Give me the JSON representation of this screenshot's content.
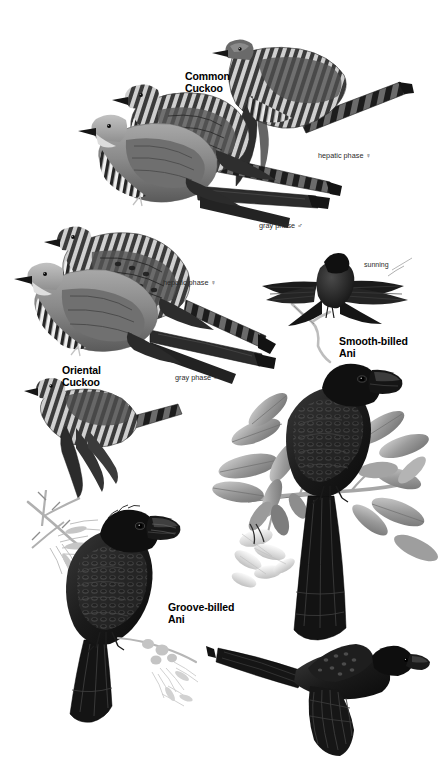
{
  "plate": {
    "background_color": "#ffffff",
    "width": 443,
    "height": 765,
    "medium": "grayscale field-guide illustration plate"
  },
  "species_labels": [
    {
      "id": "common-cuckoo",
      "text": "Common\nCuckoo",
      "x": 185,
      "y": 71
    },
    {
      "id": "oriental-cuckoo",
      "text": "Oriental\nCuckoo",
      "x": 62,
      "y": 365
    },
    {
      "id": "smooth-billed-ani",
      "text": "Smooth-billed\nAni",
      "x": 339,
      "y": 336
    },
    {
      "id": "groove-billed-ani",
      "text": "Groove-billed\nAni",
      "x": 168,
      "y": 602
    }
  ],
  "phase_labels": [
    {
      "id": "common-hepatic",
      "text": "hepatic phase ♀",
      "x": 318,
      "y": 152
    },
    {
      "id": "common-gray",
      "text": "gray phase ♂",
      "x": 259,
      "y": 222
    },
    {
      "id": "oriental-hepatic",
      "text": "hepatic phase ♀",
      "x": 163,
      "y": 279
    },
    {
      "id": "oriental-gray",
      "text": "gray phase ♂",
      "x": 175,
      "y": 374
    }
  ],
  "callout_labels": [
    {
      "id": "sunning",
      "text": "sunning",
      "x": 364,
      "y": 261
    }
  ],
  "colors": {
    "ink_black": "#111111",
    "plumage_dark": "#2b2b2b",
    "plumage_mid": "#6e6e6e",
    "plumage_light": "#b9b9b9",
    "plumage_pale": "#e2e2e2",
    "foliage_mid": "#8d8d8d",
    "foliage_light": "#c9c9c9",
    "label_text": "#000000",
    "annotation_text": "#2a2a2a",
    "background": "#ffffff"
  },
  "figures": [
    {
      "id": "common-cuckoo-hepatic-flight",
      "species": "Common Cuckoo",
      "phase": "hepatic phase female",
      "pose": "flight, viewed from side"
    },
    {
      "id": "common-cuckoo-hepatic-perched",
      "species": "Common Cuckoo",
      "phase": "hepatic phase female",
      "pose": "perched, barred rufous plumage"
    },
    {
      "id": "common-cuckoo-gray-perched",
      "species": "Common Cuckoo",
      "phase": "gray phase male",
      "pose": "perched, gray above, barred below"
    },
    {
      "id": "oriental-cuckoo-hepatic",
      "species": "Oriental Cuckoo",
      "phase": "hepatic phase female",
      "pose": "perched, heavily barred"
    },
    {
      "id": "oriental-cuckoo-gray",
      "species": "Oriental Cuckoo",
      "phase": "gray phase male",
      "pose": "perched, gray above"
    },
    {
      "id": "oriental-cuckoo-flight",
      "species": "Oriental Cuckoo",
      "phase": "hepatic phase female",
      "pose": "flight, wings down"
    },
    {
      "id": "smooth-billed-ani-sunning",
      "species": "Smooth-billed Ani",
      "phase": "",
      "pose": "sunning, wings spread, on branch"
    },
    {
      "id": "smooth-billed-ani-perched",
      "species": "Smooth-billed Ani",
      "phase": "",
      "pose": "perched on leafy flowering branch"
    },
    {
      "id": "groove-billed-ani-perched",
      "species": "Groove-billed Ani",
      "phase": "",
      "pose": "perched on thorny acacia branch"
    },
    {
      "id": "groove-billed-ani-flight",
      "species": "Groove-billed Ani",
      "phase": "",
      "pose": "flight, long tail trailing"
    }
  ]
}
